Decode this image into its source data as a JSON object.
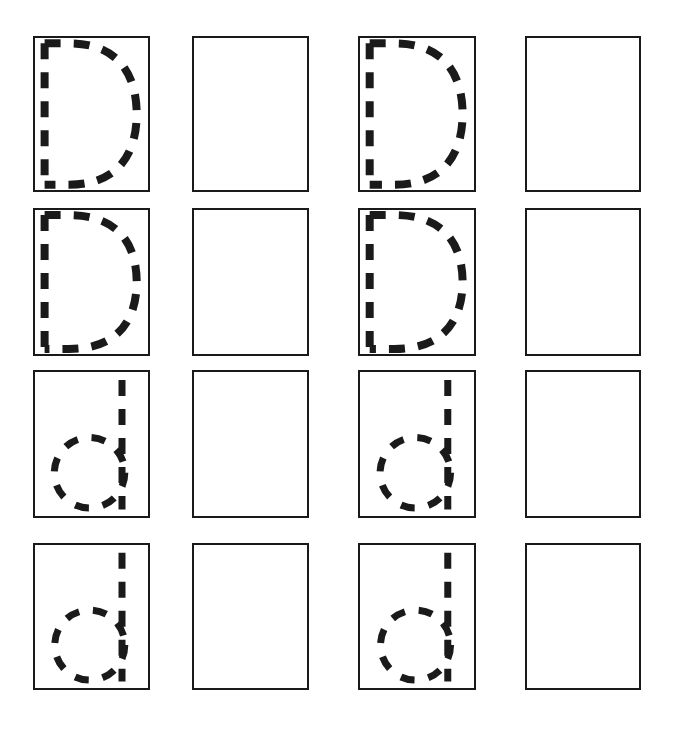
{
  "worksheet": {
    "type": "handwriting-tracing-worksheet",
    "letter": "D",
    "description": "Letter D tracing practice grid: dashed guide letters in columns 1 and 3, blank practice boxes in columns 2 and 4",
    "canvas": {
      "width": 674,
      "height": 732
    },
    "colors": {
      "page_background": "#ffffff",
      "box_border": "#1a1a1a",
      "stroke": "#1a1a1a",
      "box_fill": "#ffffff"
    },
    "grid": {
      "rows": 4,
      "columns": 4,
      "column_left": [
        33,
        192,
        358,
        525
      ],
      "column_width": [
        117,
        117,
        118,
        116
      ],
      "row_top": [
        36,
        208,
        370,
        543
      ],
      "row_height": [
        156,
        148,
        148,
        147
      ],
      "border_width_px": 2
    },
    "stroke_style": {
      "dash_cap": "butt",
      "uppercase_stem_width_px": 8,
      "uppercase_bowl_width_px": 8,
      "lowercase_stem_width_px": 7,
      "lowercase_bowl_width_px": 7,
      "dash_on_px": 16,
      "dash_off_px": 13
    },
    "cells": [
      {
        "row": 1,
        "column": 1,
        "content": "dashed-uppercase-d",
        "label": "D",
        "case": "uppercase",
        "blank": false
      },
      {
        "row": 1,
        "column": 2,
        "content": "blank-practice-box",
        "label": "",
        "case": "none",
        "blank": true
      },
      {
        "row": 1,
        "column": 3,
        "content": "dashed-uppercase-d",
        "label": "D",
        "case": "uppercase",
        "blank": false
      },
      {
        "row": 1,
        "column": 4,
        "content": "blank-practice-box",
        "label": "",
        "case": "none",
        "blank": true
      },
      {
        "row": 2,
        "column": 1,
        "content": "dashed-uppercase-d",
        "label": "D",
        "case": "uppercase",
        "blank": false
      },
      {
        "row": 2,
        "column": 2,
        "content": "blank-practice-box",
        "label": "",
        "case": "none",
        "blank": true
      },
      {
        "row": 2,
        "column": 3,
        "content": "dashed-uppercase-d",
        "label": "D",
        "case": "uppercase",
        "blank": false
      },
      {
        "row": 2,
        "column": 4,
        "content": "blank-practice-box",
        "label": "",
        "case": "none",
        "blank": true
      },
      {
        "row": 3,
        "column": 1,
        "content": "dashed-lowercase-d",
        "label": "d",
        "case": "lowercase",
        "blank": false
      },
      {
        "row": 3,
        "column": 2,
        "content": "blank-practice-box",
        "label": "",
        "case": "none",
        "blank": true
      },
      {
        "row": 3,
        "column": 3,
        "content": "dashed-lowercase-d",
        "label": "d",
        "case": "lowercase",
        "blank": false
      },
      {
        "row": 3,
        "column": 4,
        "content": "blank-practice-box",
        "label": "",
        "case": "none",
        "blank": true
      },
      {
        "row": 4,
        "column": 1,
        "content": "dashed-lowercase-d",
        "label": "d",
        "case": "lowercase",
        "blank": false
      },
      {
        "row": 4,
        "column": 2,
        "content": "blank-practice-box",
        "label": "",
        "case": "none",
        "blank": true
      },
      {
        "row": 4,
        "column": 3,
        "content": "dashed-lowercase-d",
        "label": "d",
        "case": "lowercase",
        "blank": false
      },
      {
        "row": 4,
        "column": 4,
        "content": "blank-practice-box",
        "label": "",
        "case": "none",
        "blank": true
      }
    ]
  }
}
